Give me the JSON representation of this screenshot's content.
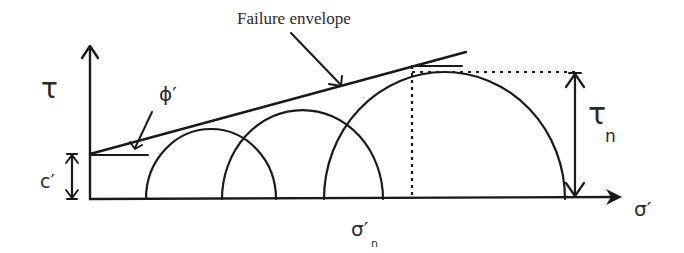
{
  "labels": {
    "failure_envelope": "Failure envelope",
    "tau_axis": "τ",
    "sigma_axis": "σ′",
    "phi": "ϕ′",
    "cohesion": "c′",
    "tau_n_main": "τ",
    "tau_n_sub": "n",
    "sigma_n_main": "σ′",
    "sigma_n_sub": "n"
  },
  "colors": {
    "line": "#1a1a1a",
    "text": "#2a2a2a",
    "background": "#ffffff"
  },
  "axes": {
    "origin": [
      90,
      199
    ],
    "y_axis_top": 46,
    "x_axis_end": 622
  },
  "envelope": {
    "start": [
      90,
      154
    ],
    "end": [
      466,
      52
    ]
  },
  "circles": [
    {
      "left": 146,
      "right": 276,
      "top": 129
    },
    {
      "left": 222,
      "right": 383,
      "top": 110
    },
    {
      "left": 324,
      "right": 565,
      "top": 72
    }
  ],
  "markers": {
    "sigma_n_x": 412,
    "tau_n_y": 72,
    "tau_n_arrow_x": 575,
    "cohesion_arrow_x": 72
  }
}
